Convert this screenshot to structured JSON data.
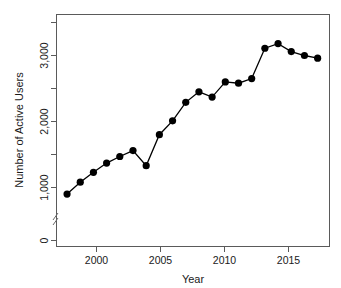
{
  "chart_data": {
    "type": "line",
    "title": "",
    "xlabel": "Year",
    "ylabel": "Number of Active Users",
    "x": [
      1998,
      1999,
      2000,
      2001,
      2002,
      2003,
      2004,
      2005,
      2006,
      2007,
      2008,
      2009,
      2010,
      2011,
      2012,
      2013,
      2014,
      2015,
      2016,
      2017
    ],
    "values": [
      900,
      1080,
      1230,
      1370,
      1470,
      1560,
      1330,
      1800,
      2010,
      2290,
      2450,
      2370,
      2600,
      2580,
      2650,
      3110,
      3180,
      3060,
      3000,
      2960
    ],
    "series": [
      {
        "name": "Number of Active Users",
        "values": [
          900,
          1080,
          1230,
          1370,
          1470,
          1560,
          1330,
          1800,
          2010,
          2290,
          2450,
          2370,
          2600,
          2580,
          2650,
          3110,
          3180,
          3060,
          3000,
          2960
        ]
      }
    ],
    "xlim": [
      1997.3,
      1997.3
    ],
    "x_axis": {
      "min": 1997.2,
      "max": 2017.9,
      "tick_labels": [
        "2000",
        "2005",
        "2010",
        "2015"
      ],
      "tick_values": [
        2000,
        2005,
        2010,
        2015
      ]
    },
    "y_axis": {
      "min": 0,
      "max": 3450,
      "tick_labels": [
        "0",
        "1,000",
        "2,000",
        "3,000"
      ],
      "tick_values": [
        0,
        1000,
        2000,
        3000
      ],
      "minor_tick_values": [
        500,
        1500,
        2500,
        3450
      ],
      "broken_axis": true,
      "break_note": "axis break between 0 and 1,000"
    },
    "ylim": [
      0,
      3450
    ],
    "grid": false,
    "legend": "none",
    "marker": "filled-circle",
    "line_color": "#000000",
    "marker_color": "#000000",
    "background_color": "#ffffff"
  }
}
